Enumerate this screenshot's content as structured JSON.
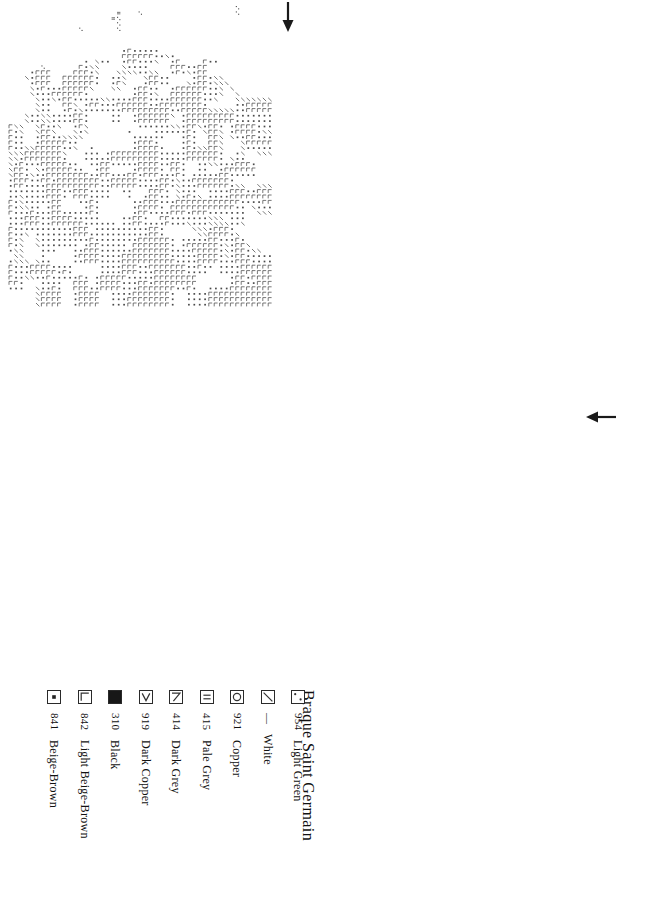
{
  "document": {
    "title": "Braque Saint Germain",
    "type": "cross-stitch-pattern-chart"
  },
  "chart_meta": {
    "grid": {
      "columns": 118,
      "rows": 162,
      "cell_px": 5.4,
      "bold_every": 10,
      "origin_x": 8,
      "origin_y": 5
    },
    "center_markers": [
      {
        "name": "top-center-arrow",
        "glyph": "arrow-down",
        "x": 288,
        "y": 18
      },
      {
        "name": "right-center-arrow",
        "glyph": "arrow-left",
        "x": 601,
        "y": 420
      }
    ]
  },
  "legend": {
    "title": "Braque Saint Germain",
    "entries": [
      {
        "symbol": "two-dots",
        "code": "954",
        "name": "Light Green"
      },
      {
        "symbol": "backslash",
        "code": "—",
        "name": "White"
      },
      {
        "symbol": "circle",
        "code": "921",
        "name": "Copper"
      },
      {
        "symbol": "double-bar",
        "code": "415",
        "name": "Pale Grey"
      },
      {
        "symbol": "seven",
        "code": "414",
        "name": "Dark Grey"
      },
      {
        "symbol": "vee",
        "code": "919",
        "name": "Dark Copper"
      },
      {
        "symbol": "filled-square",
        "code": "310",
        "name": "Black"
      },
      {
        "symbol": "corner-l",
        "code": "842",
        "name": "Light Beige-Brown"
      },
      {
        "symbol": "center-dot",
        "code": "841",
        "name": "Beige-Brown"
      }
    ]
  },
  "colors": {
    "ink": "#1a1a1a",
    "grid_thin": "#9a9a9a",
    "grid_bold": "#333333",
    "paper": "#ffffff",
    "symbol": "#555555"
  }
}
